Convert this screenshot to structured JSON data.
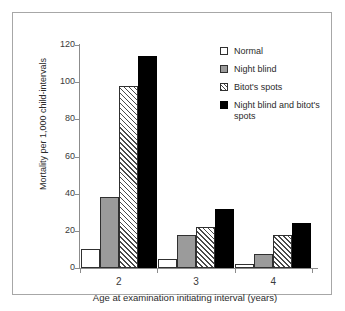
{
  "chart_data": {
    "type": "bar",
    "title": "",
    "xlabel": "Age at examination initiating interval (years)",
    "ylabel": "Mortality per 1,000 child-intervals",
    "categories": [
      "2",
      "3",
      "4"
    ],
    "ylim": [
      0,
      120
    ],
    "yticks": [
      0,
      20,
      40,
      60,
      80,
      100,
      120
    ],
    "ytick_labels": [
      "0",
      "20",
      "40",
      "60",
      "80",
      "100",
      "120"
    ],
    "grid": false,
    "legend_position": "top-right",
    "series": [
      {
        "name": "Normal",
        "values": [
          10,
          5,
          2
        ],
        "color": "#ffffff",
        "fill": "solid-white"
      },
      {
        "name": "Night blind",
        "values": [
          38,
          18,
          7.5
        ],
        "color": "#9b9b9b",
        "fill": "solid-gray"
      },
      {
        "name": "Bitot's spots",
        "values": [
          98,
          22,
          18
        ],
        "color": "#ffffff",
        "fill": "diagonal-hatch"
      },
      {
        "name": "Night blind and bitot's spots",
        "values": [
          114,
          32,
          24
        ],
        "color": "#000000",
        "fill": "solid-black"
      }
    ]
  },
  "axis": {
    "y_title": "Mortality per 1,000 child-intervals",
    "x_title": "Age at examination initiating interval (years)"
  },
  "legend": {
    "items": [
      {
        "label": "Normal"
      },
      {
        "label": "Night blind"
      },
      {
        "label": "Bitot's spots"
      },
      {
        "label": "Night blind and bitot's spots"
      }
    ]
  }
}
